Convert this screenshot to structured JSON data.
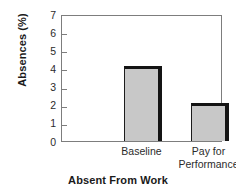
{
  "chart_data": {
    "type": "bar",
    "title": "",
    "xlabel": "Absent From Work",
    "ylabel": "Absences (%)",
    "categories": [
      "Baseline",
      "Pay for\nPerformance"
    ],
    "values": [
      4.15,
      2.1
    ],
    "ylim": [
      0,
      7
    ],
    "yticks": [
      "0",
      "1",
      "2",
      "3",
      "4",
      "5",
      "6",
      "7"
    ],
    "grid": false,
    "legend": "none",
    "bar_fill_color": "#c8c8c8",
    "bar_edge_color": "#141414",
    "frame_color": "#7d7d7d",
    "background_color": "#ffffff"
  }
}
